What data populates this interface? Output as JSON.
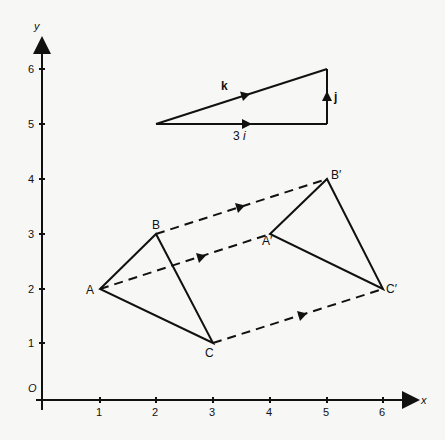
{
  "diagram": {
    "type": "translation-diagram",
    "axes": {
      "x_label": "x",
      "y_label": "y",
      "origin_label": "O",
      "x_ticks": [
        "1",
        "2",
        "3",
        "4",
        "5",
        "6"
      ],
      "y_ticks": [
        "1",
        "2",
        "3",
        "4",
        "5",
        "6"
      ]
    },
    "triangle_original": {
      "vertices": [
        {
          "label": "A",
          "x": 1,
          "y": 2
        },
        {
          "label": "B",
          "x": 2,
          "y": 3
        },
        {
          "label": "C",
          "x": 3,
          "y": 1
        }
      ]
    },
    "triangle_image": {
      "vertices": [
        {
          "label": "A′",
          "x": 4,
          "y": 3
        },
        {
          "label": "B′",
          "x": 5,
          "y": 4
        },
        {
          "label": "C′",
          "x": 6,
          "y": 2
        }
      ]
    },
    "translation_vector": {
      "resultant_label": "k",
      "horizontal_label": "3",
      "horizontal_unit": "i",
      "vertical_label": "j",
      "start": {
        "x": 2,
        "y": 5
      },
      "corner": {
        "x": 5,
        "y": 5
      },
      "end": {
        "x": 5,
        "y": 6
      }
    },
    "colors": {
      "ink": "#111111",
      "background": "#f7f7f5"
    }
  }
}
